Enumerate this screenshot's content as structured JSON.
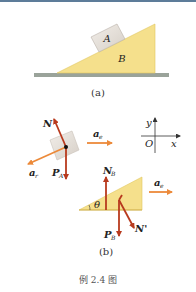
{
  "figure_a": {
    "block_label": "A",
    "wedge_label": "B",
    "caption": "(a)"
  },
  "figure_b": {
    "block_forces": {
      "normal": "N",
      "gravity_main": "P",
      "gravity_sub": "A",
      "relative_accel_main": "a",
      "relative_accel_sub": "r",
      "convected_accel_main": "a",
      "convected_accel_sub": "e"
    },
    "axes": {
      "y_label": "y",
      "x_label": "x",
      "origin_label": "O"
    },
    "wedge_forces": {
      "normal_main": "N",
      "normal_sub": "B",
      "gravity_main": "P",
      "gravity_sub": "B",
      "reaction": "N'",
      "angle": "θ",
      "accel_main": "a",
      "accel_sub": "e"
    },
    "caption": "(b)"
  },
  "figure_caption": "例 2.4 图",
  "colors": {
    "wedge_fill": "#f5e08c",
    "block_fill": "#e6e0da",
    "ground": "#9aa39a",
    "force_arrow": "#b83a1e",
    "accel_arrow": "#ec8a3a",
    "top_bar": "#5d7c99"
  }
}
